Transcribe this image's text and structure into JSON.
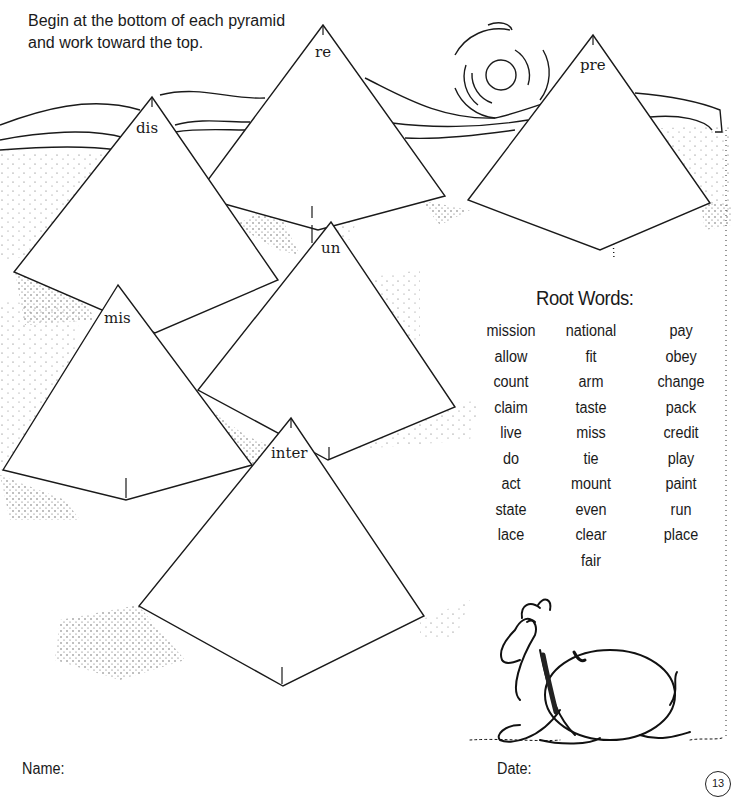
{
  "instructions": {
    "line1": "Begin at the bottom of each pyramid",
    "line2": "and work toward the top."
  },
  "pyramids": [
    {
      "prefix": "re"
    },
    {
      "prefix": "dis"
    },
    {
      "prefix": "pre"
    },
    {
      "prefix": "un"
    },
    {
      "prefix": "mis"
    },
    {
      "prefix": "inter"
    }
  ],
  "root_words": {
    "title": "Root Words:",
    "columns": [
      [
        "mission",
        "allow",
        "count",
        "claim",
        "live",
        "do",
        "act",
        "state",
        "lace"
      ],
      [
        "national",
        "fit",
        "arm",
        "taste",
        "miss",
        "tie",
        "mount",
        "even",
        "clear",
        "fair"
      ],
      [
        "pay",
        "obey",
        "change",
        "pack",
        "credit",
        "play",
        "paint",
        "run",
        "place"
      ]
    ]
  },
  "footer": {
    "name_label": "Name:",
    "date_label": "Date:",
    "page_number": "13"
  },
  "illustrations": [
    "sun-icon",
    "camel-icon",
    "desert-dunes"
  ]
}
